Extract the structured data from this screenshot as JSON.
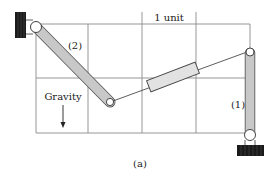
{
  "diagram": {
    "unit_label": "1 unit",
    "link2_label": "(2)",
    "link1_label": "(1)",
    "gravity_label": "Gravity",
    "caption": "(a)"
  },
  "colors": {
    "grid": "#7a7a7a",
    "link_fill": "#c8c8c8",
    "link_stroke": "#555555",
    "wall": "#1a1a1a",
    "slider_fill": "#e2e2e2",
    "string": "#333333"
  },
  "icons": {
    "gravity_arrow": "arrow-down-icon"
  }
}
